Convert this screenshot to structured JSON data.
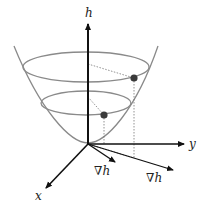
{
  "diagram": {
    "type": "3d-paraboloid-gradient",
    "axes": {
      "vertical_label": "h",
      "y_label": "y",
      "x_label": "x"
    },
    "gradient_labels": [
      "∇h",
      "∇h"
    ],
    "colors": {
      "axis": "#111111",
      "surface": "#8a8a8a",
      "point": "#3a3a3a",
      "dotted": "#777777"
    }
  }
}
